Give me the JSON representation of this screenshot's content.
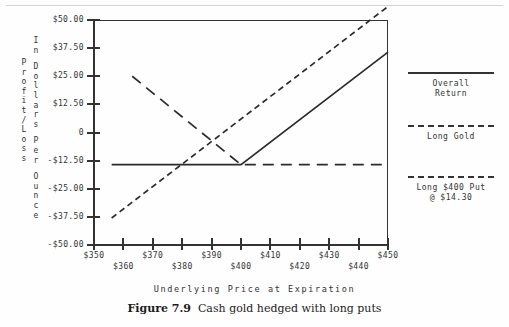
{
  "figure": {
    "number_label": "Figure 7.9",
    "caption": "Cash gold hedged with long puts",
    "x_axis_caption": "Underlying Price at Expiration"
  },
  "axis_titles": {
    "outer_vertical": "Profit/Loss",
    "inner_vertical_lines": [
      "In",
      "Dollars",
      "Per",
      "Ounce"
    ]
  },
  "legend": {
    "items": [
      {
        "label_line1": "Overall",
        "label_line2": "Return",
        "style": "solid"
      },
      {
        "label_line1": "Long Gold",
        "label_line2": "",
        "style": "short-dash"
      },
      {
        "label_line1": "Long $400 Put",
        "label_line2": "@ $14.30",
        "style": "long-dash"
      }
    ]
  },
  "chart_data": {
    "type": "line",
    "title": "Cash gold hedged with long puts",
    "xlabel": "Underlying Price at Expiration",
    "ylabel": "Profit/Loss In Dollars Per Ounce",
    "grid": false,
    "legend_position": "right",
    "xlim": [
      350,
      450
    ],
    "ylim": [
      -50,
      50
    ],
    "x_ticks": [
      350,
      360,
      370,
      380,
      390,
      400,
      410,
      420,
      430,
      440,
      450
    ],
    "x_tick_labels": [
      "$350",
      "$360",
      "$370",
      "$380",
      "$390",
      "$400",
      "$410",
      "$420",
      "$430",
      "$440",
      "$450"
    ],
    "x_tick_label_rows": [
      1,
      2,
      1,
      2,
      1,
      2,
      1,
      2,
      1,
      2,
      1
    ],
    "y_ticks": [
      50,
      37.5,
      25,
      12.5,
      0,
      -12.5,
      -25,
      -37.5,
      -50
    ],
    "y_tick_labels": [
      "$50.00",
      "$37.50",
      "$25.00",
      "$12.50",
      "0",
      "-$12.50",
      "-$25.00",
      "-$37.50",
      "-$50.00"
    ],
    "series": [
      {
        "name": "Overall Return",
        "style": "solid",
        "x": [
          356,
          400,
          450
        ],
        "y": [
          -14.3,
          -14.3,
          35.7
        ],
        "note": "flat at the put premium loss below $400, then rises one-for-one"
      },
      {
        "name": "Long Gold",
        "style": "short-dash",
        "x": [
          356,
          450
        ],
        "y": [
          -38.0,
          56.0
        ],
        "note": "unhedged long cash gold, linear 45-degree line"
      },
      {
        "name": "Long $400 Put @ $14.30",
        "style": "long-dash",
        "x": [
          363,
          400,
          450
        ],
        "y": [
          25.0,
          -14.3,
          -14.3
        ],
        "note": "put payoff declining to the strike then flat at premium paid"
      }
    ]
  }
}
